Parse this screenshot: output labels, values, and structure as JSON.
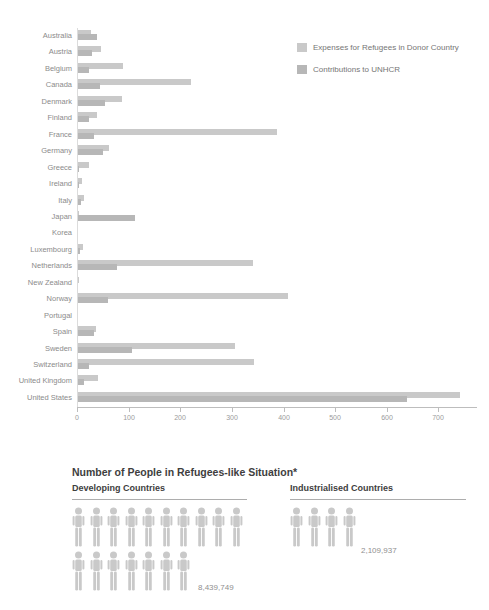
{
  "chart_data": [
    {
      "type": "bar",
      "orientation": "horizontal",
      "title": "",
      "xlabel": "",
      "ylabel": "",
      "categories": [
        "Australia",
        "Austria",
        "Belgium",
        "Canada",
        "Denmark",
        "Finland",
        "France",
        "Germany",
        "Greece",
        "Ireland",
        "Italy",
        "Japan",
        "Korea",
        "Luxembourg",
        "Netherlands",
        "New Zealand",
        "Norway",
        "Portugal",
        "Spain",
        "Sweden",
        "Switzerland",
        "United Kingdom",
        "United States"
      ],
      "series": [
        {
          "name": "Expenses for Refugees in Donor Country",
          "values": [
            27,
            46,
            89,
            221,
            87,
            39,
            388,
            62,
            23,
            9,
            14,
            4,
            1,
            12,
            341,
            4,
            409,
            2,
            37,
            306,
            342,
            40,
            742
          ]
        },
        {
          "name": "Contributions to UNHCR",
          "values": [
            38,
            29,
            23,
            45,
            54,
            23,
            33,
            51,
            3,
            4,
            8,
            113,
            2,
            6,
            78,
            2,
            60,
            1,
            32,
            106,
            23,
            13,
            640
          ]
        }
      ],
      "x_ticks": [
        0,
        100,
        200,
        300,
        400,
        500,
        600,
        700
      ],
      "xlim": [
        0,
        775
      ],
      "grid": false,
      "legend_position": "top-right"
    },
    {
      "type": "pictogram",
      "title": "Number of People in Refugees-like Situation*",
      "categories": [
        "Developing Countries",
        "Industrialised Countries"
      ],
      "values": [
        8439749,
        2109937
      ],
      "value_labels": [
        "8,439,749",
        "2,109,937"
      ],
      "icon": "person",
      "icon_rows": [
        [
          10,
          7
        ],
        [
          4
        ]
      ]
    }
  ],
  "legend": {
    "items": [
      {
        "label": "Expenses for Refugees in Donor Country"
      },
      {
        "label": "Contributions to UNHCR"
      }
    ]
  },
  "pictogram_section": {
    "title": "Number of People in Refugees-like Situation*",
    "developing": {
      "label": "Developing Countries",
      "value": "8,439,749"
    },
    "industrialised": {
      "label": "Industrialised Countries",
      "value": "2,109,937"
    }
  },
  "colors": {
    "bar_expenses": "#c9c9c9",
    "bar_contributions": "#b7b7b7",
    "axis": "#bdbdbd",
    "tick_label": "#9b9b9b",
    "country_label": "#8b8b8b",
    "legend_text": "#757575",
    "title_text": "#3e3e3e",
    "value_text": "#8f8f8f",
    "icon": "#c9c9c9",
    "rule": "#adadad",
    "baseline": "#dcdcdc"
  }
}
